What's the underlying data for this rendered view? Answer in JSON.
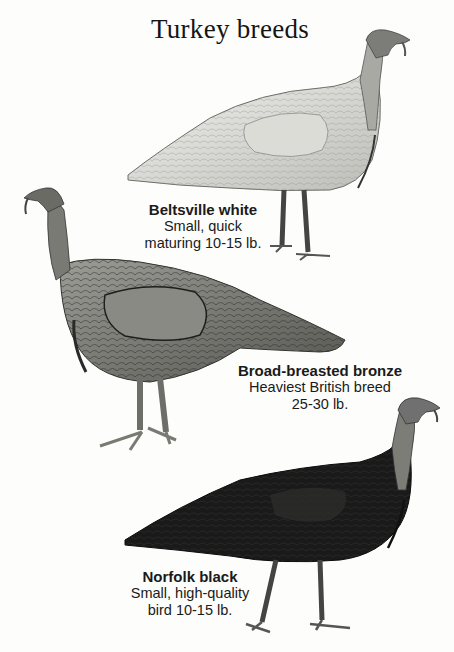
{
  "title": "Turkey breeds",
  "breeds": [
    {
      "name": "Beltsville white",
      "line1": "Small, quick",
      "line2": "maturing  10-15 lb.",
      "illustration": "white-turkey-illustration",
      "tone": "#e6e6e2"
    },
    {
      "name": "Broad-breasted bronze",
      "line1": "Heaviest British breed",
      "line2": "25-30 lb.",
      "illustration": "bronze-turkey-illustration",
      "tone": "#8a8a84"
    },
    {
      "name": "Norfolk black",
      "line1": "Small, high-quality",
      "line2": "bird  10-15 lb.",
      "illustration": "black-turkey-illustration",
      "tone": "#1b1b1b"
    }
  ]
}
